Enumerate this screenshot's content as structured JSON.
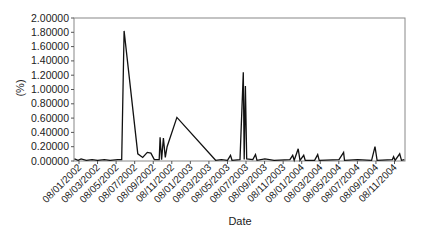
{
  "chart_data": {
    "type": "line",
    "title": "",
    "xlabel": "Date",
    "ylabel": "(%)",
    "ylim": [
      0,
      2.0
    ],
    "grid": false,
    "legend": null,
    "yticks": [
      "0.00000",
      "0.20000",
      "0.40000",
      "0.60000",
      "0.80000",
      "1.00000",
      "1.20000",
      "1.40000",
      "1.60000",
      "1.80000",
      "2.00000"
    ],
    "xticks": [
      "08/01/2002",
      "08/03/2002",
      "08/05/2002",
      "08/07/2002",
      "08/09/2002",
      "08/11/2002",
      "08/01/2003",
      "08/03/2003",
      "08/05/2003",
      "08/07/2003",
      "08/09/2003",
      "08/11/2003",
      "08/01/2004",
      "08/03/2004",
      "08/05/2004",
      "08/07/2004",
      "08/09/2004",
      "08/11/2004"
    ],
    "series": [
      {
        "name": "(%)",
        "color": "#111111",
        "points": [
          {
            "x": "2001-12-20",
            "y": 0.03
          },
          {
            "x": "2002-01-05",
            "y": 0.01
          },
          {
            "x": "2002-01-15",
            "y": 0.03
          },
          {
            "x": "2002-02-01",
            "y": 0.01
          },
          {
            "x": "2002-02-20",
            "y": 0.02
          },
          {
            "x": "2002-03-10",
            "y": 0.01
          },
          {
            "x": "2002-04-01",
            "y": 0.02
          },
          {
            "x": "2002-04-20",
            "y": 0.01
          },
          {
            "x": "2002-05-15",
            "y": 0.02
          },
          {
            "x": "2002-05-28",
            "y": 0.02
          },
          {
            "x": "2002-06-05",
            "y": 1.82
          },
          {
            "x": "2002-07-20",
            "y": 0.1
          },
          {
            "x": "2002-08-05",
            "y": 0.05
          },
          {
            "x": "2002-08-20",
            "y": 0.12
          },
          {
            "x": "2002-09-01",
            "y": 0.11
          },
          {
            "x": "2002-09-12",
            "y": 0.02
          },
          {
            "x": "2002-09-28",
            "y": 0.02
          },
          {
            "x": "2002-10-01",
            "y": 0.33
          },
          {
            "x": "2002-10-06",
            "y": 0.02
          },
          {
            "x": "2002-10-12",
            "y": 0.32
          },
          {
            "x": "2002-10-18",
            "y": 0.05
          },
          {
            "x": "2002-10-24",
            "y": 0.2
          },
          {
            "x": "2002-11-25",
            "y": 0.61
          },
          {
            "x": "2003-04-01",
            "y": 0.01
          },
          {
            "x": "2003-04-20",
            "y": 0.02
          },
          {
            "x": "2003-05-10",
            "y": 0.01
          },
          {
            "x": "2003-05-20",
            "y": 0.08
          },
          {
            "x": "2003-05-25",
            "y": 0.01
          },
          {
            "x": "2003-06-20",
            "y": 0.02
          },
          {
            "x": "2003-07-01",
            "y": 1.24
          },
          {
            "x": "2003-07-04",
            "y": 0.02
          },
          {
            "x": "2003-07-08",
            "y": 1.05
          },
          {
            "x": "2003-07-12",
            "y": 0.03
          },
          {
            "x": "2003-08-01",
            "y": 0.02
          },
          {
            "x": "2003-08-10",
            "y": 0.09
          },
          {
            "x": "2003-08-15",
            "y": 0.01
          },
          {
            "x": "2003-09-10",
            "y": 0.03
          },
          {
            "x": "2003-10-10",
            "y": 0.01
          },
          {
            "x": "2003-12-01",
            "y": 0.02
          },
          {
            "x": "2003-12-10",
            "y": 0.08
          },
          {
            "x": "2003-12-15",
            "y": 0.01
          },
          {
            "x": "2003-12-28",
            "y": 0.17
          },
          {
            "x": "2004-01-03",
            "y": 0.01
          },
          {
            "x": "2004-01-15",
            "y": 0.08
          },
          {
            "x": "2004-01-20",
            "y": 0.01
          },
          {
            "x": "2004-02-20",
            "y": 0.01
          },
          {
            "x": "2004-03-01",
            "y": 0.09
          },
          {
            "x": "2004-03-06",
            "y": 0.01
          },
          {
            "x": "2004-05-10",
            "y": 0.02
          },
          {
            "x": "2004-05-25",
            "y": 0.12
          },
          {
            "x": "2004-05-28",
            "y": 0.01
          },
          {
            "x": "2004-07-10",
            "y": 0.02
          },
          {
            "x": "2004-08-25",
            "y": 0.01
          },
          {
            "x": "2004-09-05",
            "y": 0.2
          },
          {
            "x": "2004-09-12",
            "y": 0.01
          },
          {
            "x": "2004-11-01",
            "y": 0.02
          },
          {
            "x": "2004-11-05",
            "y": 0.06
          },
          {
            "x": "2004-11-10",
            "y": 0.01
          },
          {
            "x": "2004-11-25",
            "y": 0.1
          },
          {
            "x": "2004-12-01",
            "y": 0.01
          },
          {
            "x": "2004-12-10",
            "y": 0.02
          }
        ]
      }
    ]
  },
  "labels": {
    "xlabel": "Date",
    "ylabel": "(%)"
  }
}
